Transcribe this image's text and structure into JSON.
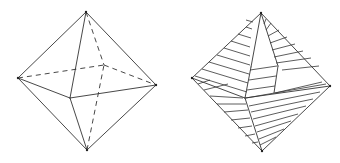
{
  "figures": [
    {
      "name": "octahedron-wireframe",
      "vertices": {
        "top": [
          86,
          12
        ],
        "left": [
          18,
          78
        ],
        "right": [
          156,
          85
        ],
        "bottom": [
          87,
          150
        ],
        "front": [
          70,
          98
        ],
        "back": [
          104,
          65
        ]
      },
      "solid_edges": [
        [
          "top",
          "left"
        ],
        [
          "top",
          "right"
        ],
        [
          "top",
          "front"
        ],
        [
          "bottom",
          "left"
        ],
        [
          "bottom",
          "right"
        ],
        [
          "bottom",
          "front"
        ],
        [
          "left",
          "front"
        ],
        [
          "front",
          "right"
        ]
      ],
      "hidden_edges": [
        [
          "top",
          "back"
        ],
        [
          "bottom",
          "back"
        ],
        [
          "left",
          "back"
        ],
        [
          "back",
          "right"
        ]
      ]
    },
    {
      "name": "octahedron-hatched-net",
      "vertices": {
        "top": [
          261,
          13
        ],
        "left": [
          192,
          78
        ],
        "right": [
          330,
          86
        ],
        "bottom": [
          262,
          151
        ],
        "front": [
          245,
          98
        ],
        "kite_left": [
          251,
          67
        ],
        "kite_right": [
          278,
          66
        ],
        "kite_bottom_right": [
          274,
          93
        ]
      },
      "outline": [
        [
          "top",
          "left"
        ],
        [
          "top",
          "right"
        ],
        [
          "left",
          "bottom"
        ],
        [
          "right",
          "bottom"
        ],
        [
          "left",
          "front"
        ],
        [
          "front",
          "bottom"
        ],
        [
          "front",
          "right"
        ],
        [
          "top",
          "kite_left"
        ],
        [
          "kite_left",
          "front"
        ],
        [
          "top",
          "kite_right"
        ],
        [
          "kite_right",
          "kite_bottom_right"
        ]
      ]
    }
  ]
}
